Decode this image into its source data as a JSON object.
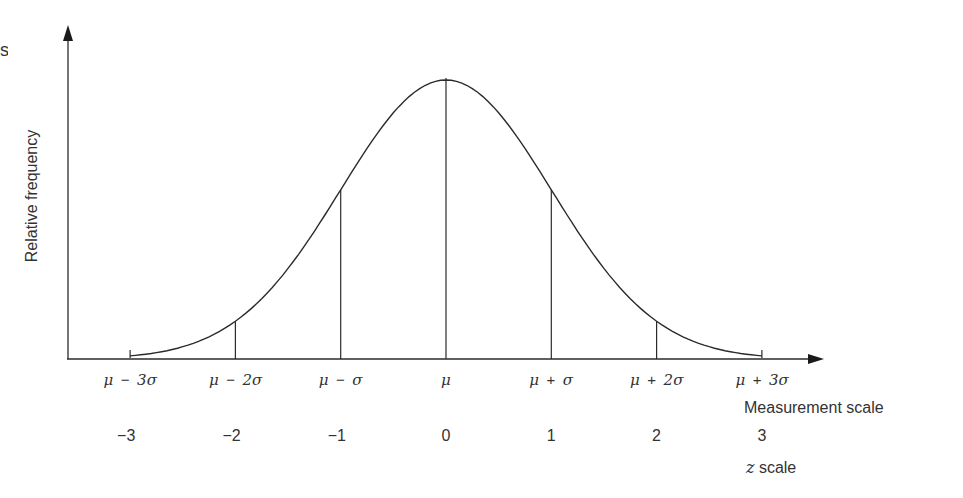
{
  "chart_data": {
    "type": "line",
    "title": "",
    "ylabel": "Relative frequency",
    "xlabel": "Measurement scale",
    "x2label": "z scale",
    "grid": false,
    "legend": null,
    "x": [
      -3,
      -2,
      -1,
      0,
      1,
      2,
      3
    ],
    "measurement_tick_labels": [
      "μ − 3σ",
      "μ − 2σ",
      "μ − σ",
      "μ",
      "μ + σ",
      "μ + 2σ",
      "μ + 3σ"
    ],
    "z_tick_labels": [
      "−3",
      "−2",
      "−1",
      "0",
      "1",
      "2",
      "3"
    ],
    "series": [
      {
        "name": "normal density",
        "x": [
          -3,
          -2.5,
          -2,
          -1.5,
          -1,
          -0.5,
          0,
          0.5,
          1,
          1.5,
          2,
          2.5,
          3
        ],
        "values": [
          0.011,
          0.044,
          0.135,
          0.325,
          0.607,
          0.882,
          1.0,
          0.882,
          0.607,
          0.325,
          0.135,
          0.044,
          0.011
        ]
      }
    ],
    "vertical_lines_at": [
      -2,
      -1,
      0,
      1,
      2
    ],
    "end_ticks_at": [
      -3,
      3
    ],
    "xlim": [
      -3.6,
      3.6
    ],
    "ylim": [
      0,
      1.2
    ]
  },
  "fragment": {
    "cut_text": "s"
  },
  "colors": {
    "line": "#2b2b2b",
    "text": "#333333",
    "background": "#ffffff"
  }
}
